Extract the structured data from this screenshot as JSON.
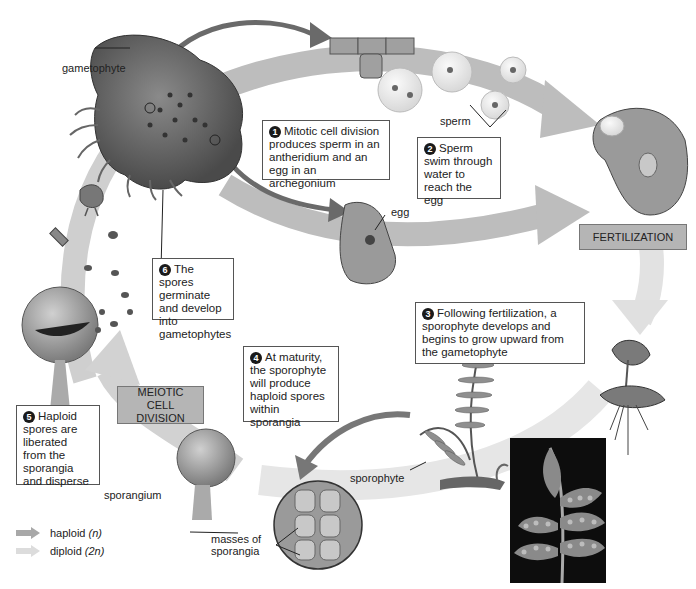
{
  "diagram": {
    "type": "life-cycle",
    "colors": {
      "haploid_arrow": "#a8a8a8",
      "diploid_arrow": "#dcdcdc",
      "stage_box": "#b5b5b5",
      "background": "#ffffff"
    }
  },
  "labels": {
    "gametophyte": "gametophyte",
    "sperm": "sperm",
    "egg": "egg",
    "sporangium": "sporangium",
    "masses_of_sporangia": "masses of sporangia",
    "sporophyte": "sporophyte"
  },
  "stages": {
    "fertilization": "FERTILIZATION",
    "meiotic_cell_division": "MEIOTIC CELL DIVISION"
  },
  "steps": [
    {
      "number": "1",
      "text": "Mitotic cell division produces sperm in an antheridium and an egg in an archegonium"
    },
    {
      "number": "2",
      "text": "Sperm swim through water to reach the egg"
    },
    {
      "number": "3",
      "text": "Following fertilization, a sporophyte develops and begins to grow upward from the gametophyte"
    },
    {
      "number": "4",
      "text": "At maturity, the sporophyte will produce haploid spores within sporangia"
    },
    {
      "number": "5",
      "text": "Haploid spores are liberated from the sporangia and disperse"
    },
    {
      "number": "6",
      "text": "The spores germinate and develop into gametophytes"
    }
  ],
  "legend": [
    {
      "label": "haploid",
      "symbol": "(n)",
      "icon": "dark-arrow"
    },
    {
      "label": "diploid",
      "symbol": "(2n)",
      "icon": "light-arrow"
    }
  ]
}
